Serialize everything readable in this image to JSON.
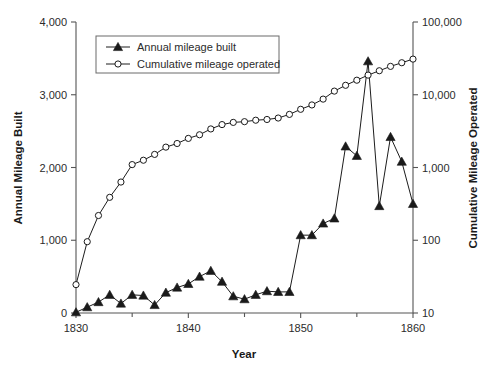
{
  "chart_data": {
    "type": "line",
    "title": "",
    "xlabel": "Year",
    "ylabel": "Annual Mileage Built",
    "y2label": "Cumulative Mileage Operated",
    "xlim": [
      1830,
      1860
    ],
    "ylim": [
      0,
      4000
    ],
    "y2lim": [
      10,
      100000
    ],
    "y2scale": "log",
    "grid": false,
    "legend_position": "top-center-inside",
    "xticks": [
      1830,
      1840,
      1850,
      1860
    ],
    "xtick_labels": [
      "1830",
      "1840",
      "1850",
      "1860"
    ],
    "xminorticks": [
      1835,
      1845,
      1855
    ],
    "yticks": [
      0,
      1000,
      2000,
      3000,
      4000
    ],
    "ytick_labels": [
      "0",
      "1,000",
      "2,000",
      "3,000",
      "4,000"
    ],
    "y2ticks": [
      10,
      100,
      1000,
      10000,
      100000
    ],
    "y2tick_labels": [
      "10",
      "100",
      "1,000",
      "10,000",
      "100,000"
    ],
    "x": [
      1830,
      1831,
      1832,
      1833,
      1834,
      1835,
      1836,
      1837,
      1838,
      1839,
      1840,
      1841,
      1842,
      1843,
      1844,
      1845,
      1846,
      1847,
      1848,
      1849,
      1850,
      1851,
      1852,
      1853,
      1854,
      1855,
      1856,
      1857,
      1858,
      1859,
      1860
    ],
    "series": [
      {
        "name": "Annual mileage built",
        "axis": "right-log",
        "marker": "triangle",
        "values": [
          10,
          16,
          26,
          40,
          24,
          42,
          40,
          23,
          47,
          71,
          87,
          128,
          164,
          105,
          62,
          47,
          61,
          101,
          98,
          98,
          199,
          202,
          1022,
          2045,
          490,
          27000,
          670,
          1060,
          380,
          780,
          250
        ],
        "left_axis_pixel_equivalent": [
          10,
          80,
          150,
          250,
          130,
          250,
          240,
          110,
          280,
          350,
          400,
          500,
          580,
          430,
          230,
          190,
          250,
          300,
          290,
          290,
          1070,
          1070,
          1230,
          1300,
          2290,
          2160,
          3460,
          1470,
          2420,
          2080,
          1500
        ]
      },
      {
        "name": "Cumulative mileage operated",
        "axis": "right-log",
        "marker": "circle",
        "values": [
          23,
          195,
          420,
          760,
          1130,
          1700,
          2500,
          3080,
          4200,
          5050,
          6150,
          7550,
          9300,
          11000,
          12500,
          13800,
          15100,
          16400,
          17700,
          18700,
          19600,
          20800,
          22300,
          24500,
          25400,
          26200,
          27000,
          27700,
          28400,
          29100,
          30000
        ],
        "left_axis_pixel_equivalent": [
          390,
          980,
          1340,
          1590,
          1800,
          2040,
          2100,
          2180,
          2280,
          2330,
          2400,
          2450,
          2530,
          2590,
          2620,
          2630,
          2650,
          2660,
          2680,
          2730,
          2800,
          2860,
          2940,
          3050,
          3130,
          3200,
          3270,
          3330,
          3390,
          3440,
          3490
        ]
      }
    ],
    "legend": [
      {
        "label": "Annual mileage built",
        "marker": "triangle"
      },
      {
        "label": "Cumulative mileage operated",
        "marker": "circle"
      }
    ],
    "colors": {
      "line": "#1c1c1c",
      "axis": "#555555",
      "text": "#2b2b2b",
      "background": "#ffffff"
    }
  }
}
